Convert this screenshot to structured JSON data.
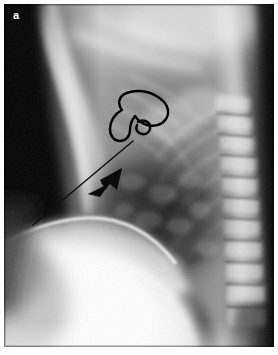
{
  "figure": {
    "panel_letter": "a",
    "modality": "chest-radiograph",
    "projection": "lateral",
    "plate": {
      "x": 4,
      "y": 4,
      "width": 270,
      "height": 343,
      "background_color": "#0a0a0a",
      "page_background_color": "#ffffff"
    },
    "tones": {
      "air_black": "#070707",
      "lung_dark_gray": "#4b4b4b",
      "soft_tissue_gray": "#8e8e8e",
      "mid_gray": "#a9a9a9",
      "bone_light": "#d6d6d6",
      "diaphragm_white": "#f4f4f4",
      "highlight_white": "#ffffff",
      "annotation_ink": "#000000"
    },
    "annotations": [
      {
        "id": "hernia-outline",
        "name": "hand-drawn-outline",
        "shape": "closed-loop-with-inner-circle",
        "ink_color": "#000000",
        "stroke_width": 2.2,
        "center_x": 138,
        "center_y": 120,
        "width": 52,
        "height": 48
      },
      {
        "id": "pointer-line",
        "name": "long-diagonal-leader-line",
        "ink_color": "#141414",
        "stroke_width": 1.4,
        "from_x": 131,
        "from_y": 139,
        "to_x": 33,
        "to_y": 224
      },
      {
        "id": "marker-arrow",
        "name": "black-arrow-marker",
        "ink_color": "#0b0b0b",
        "direction": "down-left",
        "tip_x": 88,
        "tip_y": 192,
        "tail_x": 122,
        "tail_y": 167
      }
    ],
    "anatomy_labels": [
      "thoracic-spine",
      "sternum",
      "cardiac-silhouette",
      "diaphragm",
      "retrocardiac-lung-field",
      "posterior-costophrenic-recess",
      "scapular-shadow"
    ]
  }
}
